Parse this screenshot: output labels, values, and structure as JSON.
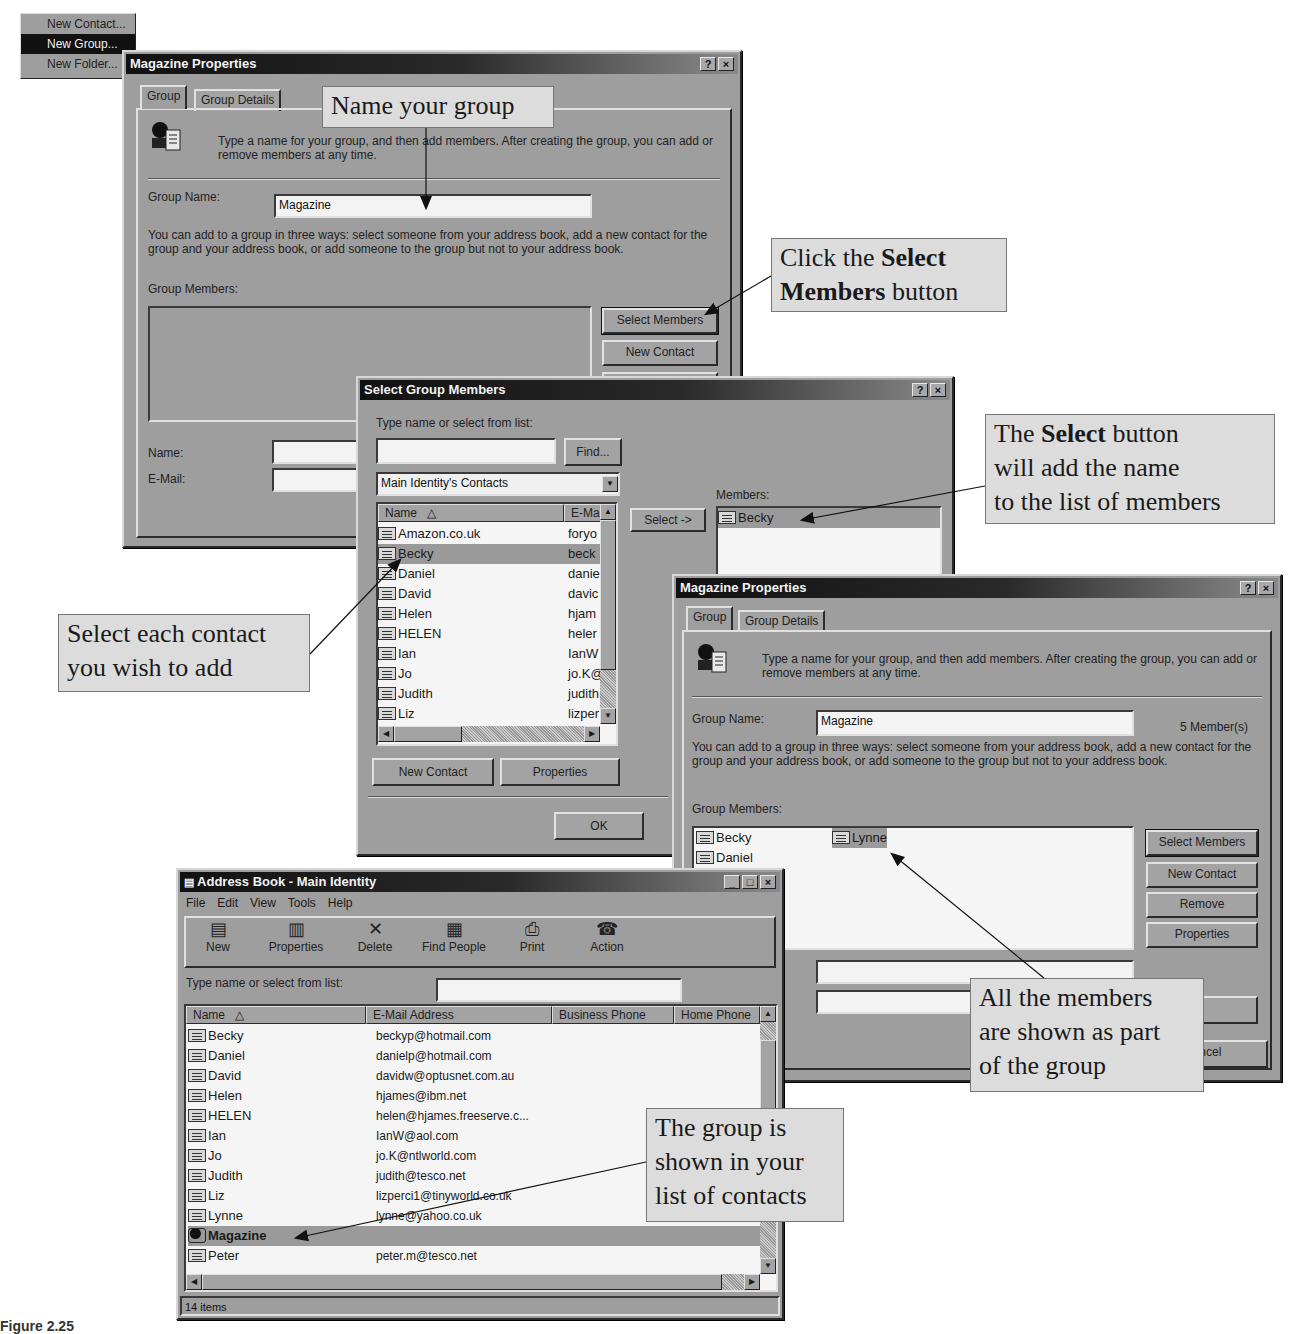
{
  "context_menu": {
    "items": [
      {
        "label": "New Contact...",
        "selected": false
      },
      {
        "label": "New Group...",
        "selected": true
      },
      {
        "label": "New Folder...",
        "selected": false
      }
    ]
  },
  "dialog1": {
    "title": "Magazine Properties",
    "tabs": [
      "Group",
      "Group Details"
    ],
    "intro_text": "Type a name for your group, and then add members. After creating the group, you can add or remove members at any time.",
    "group_name_label": "Group Name:",
    "group_name_value": "Magazine",
    "ways_text": "You can add to a group in three ways: select someone from your address book, add a new contact for the group and your address book, or add someone to the group but not to your address book.",
    "group_members_label": "Group Members:",
    "buttons": {
      "select_members": "Select Members",
      "new_contact": "New Contact"
    },
    "name_label": "Name:",
    "email_label": "E-Mail:",
    "help_btn": "?",
    "close_btn": "×"
  },
  "dialog2": {
    "title": "Select Group Members",
    "search_label": "Type name or select from list:",
    "search_value": "",
    "find_button": "Find...",
    "source_dropdown": "Main Identity's Contacts",
    "columns": [
      "Name",
      "E-Ma"
    ],
    "contacts": [
      {
        "name": "Amazon.co.uk",
        "email": "foryo",
        "selected": false
      },
      {
        "name": "Becky",
        "email": "beck",
        "selected": true
      },
      {
        "name": "Daniel",
        "email": "danie",
        "selected": false
      },
      {
        "name": "David",
        "email": "davic",
        "selected": false
      },
      {
        "name": "Helen",
        "email": "hjam",
        "selected": false
      },
      {
        "name": "HELEN",
        "email": "heler",
        "selected": false
      },
      {
        "name": "Ian",
        "email": "IanW",
        "selected": false
      },
      {
        "name": "Jo",
        "email": "jo.K@",
        "selected": false
      },
      {
        "name": "Judith",
        "email": "judith",
        "selected": false
      },
      {
        "name": "Liz",
        "email": "lizper",
        "selected": false
      }
    ],
    "select_button": "Select ->",
    "members_label": "Members:",
    "members": [
      "Becky"
    ],
    "new_contact_button": "New Contact",
    "properties_button": "Properties",
    "ok_button": "OK",
    "help_btn": "?",
    "close_btn": "×"
  },
  "dialog3": {
    "title": "Magazine Properties",
    "tabs": [
      "Group",
      "Group Details"
    ],
    "intro_text": "Type a name for your group, and then add members. After creating the group, you can add or remove members at any time.",
    "group_name_label": "Group Name:",
    "group_name_value": "Magazine",
    "member_count": "5 Member(s)",
    "ways_text": "You can add to a group in three ways: select someone from your address book, add a new contact for the group and your address book, or add someone to the group but not to your address book.",
    "group_members_label": "Group Members:",
    "members_col1": [
      "Becky",
      "Daniel"
    ],
    "members_col2": [
      "Lynne"
    ],
    "buttons": {
      "select_members": "Select Members",
      "new_contact": "New Contact",
      "remove": "Remove",
      "properties": "Properties",
      "add": "d",
      "cancel": "Cancel"
    },
    "help_btn": "?",
    "close_btn": "×"
  },
  "address_book": {
    "title": "Address Book - Main Identity",
    "menu": [
      "File",
      "Edit",
      "View",
      "Tools",
      "Help"
    ],
    "toolbar": [
      {
        "label": "New",
        "icon": "new-contact-icon",
        "glyph": "▤"
      },
      {
        "label": "Properties",
        "icon": "properties-icon",
        "glyph": "▥"
      },
      {
        "label": "Delete",
        "icon": "delete-icon",
        "glyph": "✕"
      },
      {
        "label": "Find People",
        "icon": "find-people-icon",
        "glyph": "▦"
      },
      {
        "label": "Print",
        "icon": "print-icon",
        "glyph": "⎙"
      },
      {
        "label": "Action",
        "icon": "action-icon",
        "glyph": "☎"
      }
    ],
    "search_label": "Type name or select from list:",
    "search_value": "",
    "columns": [
      "Name",
      "E-Mail Address",
      "Business Phone",
      "Home Phone"
    ],
    "rows": [
      {
        "name": "Becky",
        "email": "beckyp@hotmail.com",
        "type": "contact"
      },
      {
        "name": "Daniel",
        "email": "danielp@hotmail.com",
        "type": "contact"
      },
      {
        "name": "David",
        "email": "davidw@optusnet.com.au",
        "type": "contact"
      },
      {
        "name": "Helen",
        "email": "hjames@ibm.net",
        "type": "contact"
      },
      {
        "name": "HELEN",
        "email": "helen@hjames.freeserve.c...",
        "type": "contact"
      },
      {
        "name": "Ian",
        "email": "IanW@aol.com",
        "type": "contact"
      },
      {
        "name": "Jo",
        "email": "jo.K@ntlworld.com",
        "type": "contact"
      },
      {
        "name": "Judith",
        "email": "judith@tesco.net",
        "type": "contact"
      },
      {
        "name": "Liz",
        "email": "lizperci1@tinyworld.co.uk",
        "type": "contact"
      },
      {
        "name": "Lynne",
        "email": "lynne@yahoo.co.uk",
        "type": "contact"
      },
      {
        "name": "Magazine",
        "email": "",
        "type": "group"
      },
      {
        "name": "Peter",
        "email": "peter.m@tesco.net",
        "type": "contact"
      }
    ],
    "status": "14 items"
  },
  "callouts": {
    "name_group": "Name your group",
    "click_select_members_pre": "Click the ",
    "click_select_members_bold1": "Select",
    "click_select_members_bold2": "Members",
    "click_select_members_post": " button",
    "select_button_pre": "The ",
    "select_button_bold": "Select",
    "select_button_post1": " button",
    "select_button_line2": "will add the name",
    "select_button_line3": "to the list of members",
    "select_each_line1": "Select each contact",
    "select_each_line2": "you wish to add",
    "all_members_line1": "All the members",
    "all_members_line2": "are shown as part",
    "all_members_line3": "of the group",
    "group_shown_line1": "The group is",
    "group_shown_line2": "shown in your",
    "group_shown_line3": "list of contacts"
  },
  "caption": "Figure 2.25"
}
